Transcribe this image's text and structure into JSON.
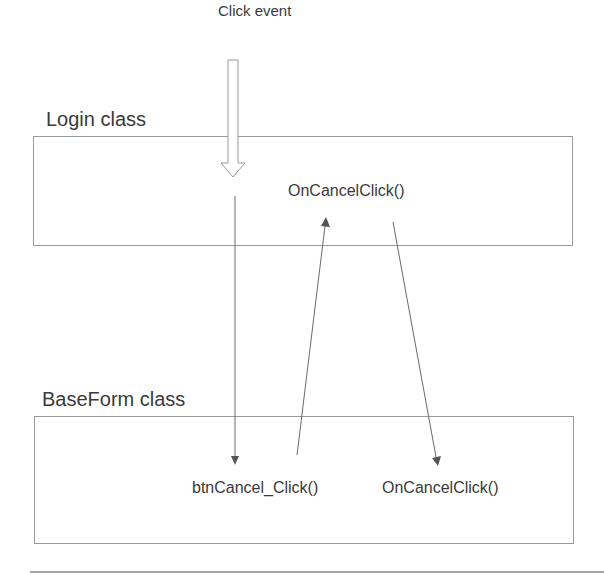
{
  "diagram": {
    "event": {
      "label": "Click event"
    },
    "classes": [
      {
        "name": "Login class",
        "methods": [
          "OnCancelClick()"
        ]
      },
      {
        "name": "BaseForm class",
        "methods": [
          "btnCancel_Click()",
          "OnCancelClick()"
        ]
      }
    ],
    "flow": [
      {
        "from": "Click event",
        "to": "Login class",
        "style": "hollow-arrow"
      },
      {
        "from": "Login class",
        "to": "btnCancel_Click()",
        "style": "line-arrow"
      },
      {
        "from": "btnCancel_Click()",
        "to": "Login.OnCancelClick()",
        "style": "line-arrow"
      },
      {
        "from": "Login.OnCancelClick()",
        "to": "BaseForm.OnCancelClick()",
        "style": "line-arrow"
      }
    ],
    "colors": {
      "line": "#6a6a6a",
      "box_border": "#9a9a9a",
      "text": "#3a3a3a"
    }
  }
}
